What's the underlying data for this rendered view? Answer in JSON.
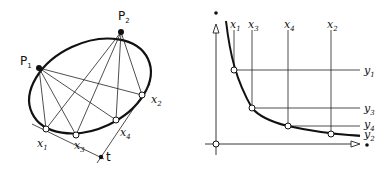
{
  "left_diagram": {
    "points_named": [
      {
        "id": "p1",
        "label": "P",
        "sub": "1"
      },
      {
        "id": "p2",
        "label": "P",
        "sub": "2"
      }
    ],
    "points_on_curve": [
      {
        "id": "x1",
        "label": "x",
        "sub": "1"
      },
      {
        "id": "x3",
        "label": "x",
        "sub": "3"
      },
      {
        "id": "x4",
        "label": "x",
        "sub": "4"
      },
      {
        "id": "x2",
        "label": "x",
        "sub": "2"
      }
    ],
    "tangent_point": {
      "label": "t"
    }
  },
  "right_diagram": {
    "x_labels": [
      {
        "label": "x",
        "sub": "1"
      },
      {
        "label": "x",
        "sub": "3"
      },
      {
        "label": "x",
        "sub": "4"
      },
      {
        "label": "x",
        "sub": "2"
      }
    ],
    "y_labels": [
      {
        "label": "y",
        "sub": "1"
      },
      {
        "label": "y",
        "sub": "3"
      },
      {
        "label": "y",
        "sub": "4"
      },
      {
        "label": "y",
        "sub": "2"
      }
    ]
  },
  "colors": {
    "ink": "#111111",
    "paper": "#ffffff"
  }
}
